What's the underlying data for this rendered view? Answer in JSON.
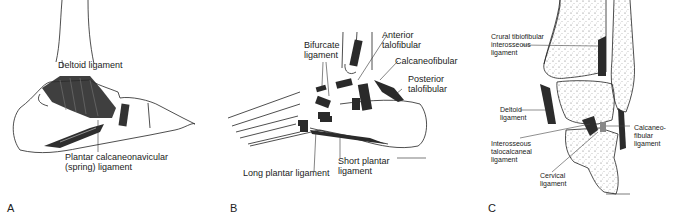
{
  "figure": {
    "panels": [
      {
        "id": "A",
        "letter": "A",
        "view": "medial ankle",
        "labels": [
          "Deltoid ligament",
          "Plantar calcaneonavicular\n(spring) ligament"
        ]
      },
      {
        "id": "B",
        "letter": "B",
        "view": "lateral ankle/foot",
        "labels": [
          "Bifurcate\nligament",
          "Anterior\ntalofibular",
          "Calcaneofibular",
          "Posterior\ntalofibular",
          "Short plantar\nligament",
          "Long plantar ligament"
        ]
      },
      {
        "id": "C",
        "letter": "C",
        "view": "coronal section",
        "labels": [
          "Crural tibiofibular\ninterosseous\nligament",
          "Deltoid\nligament",
          "Interosseous\ntalocalcaneal\nligament",
          "Calcaneo-\nfibular\nligament",
          "Cervical\nligament"
        ]
      }
    ]
  },
  "panelA": {
    "letter": "A",
    "deltoid": "Deltoid ligament",
    "spring": "Plantar calcaneonavicular\n(spring) ligament"
  },
  "panelB": {
    "letter": "B",
    "bifurcate": "Bifurcate\nligament",
    "ant_talofib": "Anterior\ntalofibular",
    "calcaneofib": "Calcaneofibular",
    "post_talofib": "Posterior\ntalofibular",
    "short_plantar": "Short plantar\nligament",
    "long_plantar": "Long plantar ligament"
  },
  "panelC": {
    "letter": "C",
    "crural": "Crural tibiofibular\ninterosseous\nligament",
    "deltoid": "Deltoid\nligament",
    "interosseous": "Interosseous\ntalocalcaneal\nligament",
    "calcaneofib": "Calcaneo-\nfibular\nligament",
    "cervical": "Cervical\nligament"
  }
}
